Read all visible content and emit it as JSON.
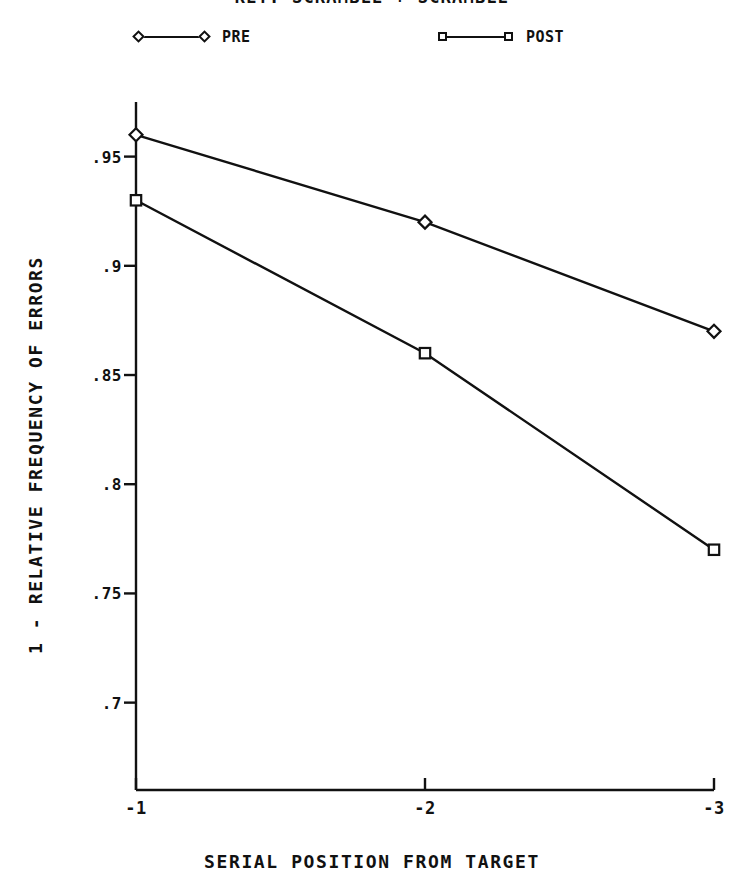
{
  "chart_data": {
    "type": "line",
    "title": "KEY: SCRAMBLE + SCRAMBLE",
    "title_clipped": true,
    "xlabel": "SERIAL POSITION FROM TARGET",
    "ylabel": "1 - RELATIVE FREQUENCY OF ERRORS",
    "categories": [
      "-1",
      "-2",
      "-3"
    ],
    "x": [
      -1,
      -2,
      -3
    ],
    "series": [
      {
        "name": "PRE",
        "marker": "diamond",
        "values": [
          0.96,
          0.92,
          0.87
        ]
      },
      {
        "name": "POST",
        "marker": "square",
        "values": [
          0.93,
          0.86,
          0.77
        ]
      }
    ],
    "yticks": [
      ".95",
      ".9",
      ".85",
      ".8",
      ".75",
      ".7"
    ],
    "ytick_values": [
      0.95,
      0.9,
      0.85,
      0.8,
      0.75,
      0.7
    ],
    "xticks": [
      "-1",
      "-2",
      "-3"
    ],
    "ylim": [
      0.66,
      0.975
    ],
    "xlim": [
      -0.72,
      -3.14
    ],
    "grid": false,
    "legend_position": "top",
    "line_color": "#111111",
    "background_color": "#ffffff"
  },
  "legend": {
    "entries": [
      {
        "label": "PRE",
        "marker": "diamond"
      },
      {
        "label": "POST",
        "marker": "square"
      }
    ]
  },
  "axes": {
    "y_title": "1 - RELATIVE FREQUENCY OF ERRORS",
    "x_title": "SERIAL POSITION FROM TARGET",
    "y_tick_labels": [
      ".95",
      ".9",
      ".85",
      ".8",
      ".75",
      ".7"
    ],
    "x_tick_labels": [
      "-1",
      "-2",
      "-3"
    ]
  }
}
